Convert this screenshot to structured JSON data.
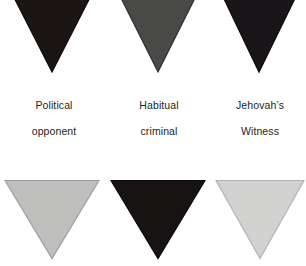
{
  "figure": {
    "background_color": "#ffffff",
    "width": 306,
    "height": 266,
    "label_text_color": "#231f20"
  },
  "badges": [
    {
      "id": "political-opponent",
      "label_line1": "Political",
      "label_line2": "opponent",
      "row": 1,
      "column": 1,
      "fill_color": "#1b1614",
      "edge_color": "#0d0b0a",
      "shape": "inverted-triangle",
      "clipped_top": true
    },
    {
      "id": "habitual-criminal",
      "label_line1": "Habitual",
      "label_line2": "criminal",
      "row": 1,
      "column": 2,
      "fill_color": "#4a4a48",
      "edge_color": "#2e2e2c",
      "shape": "inverted-triangle",
      "clipped_top": true
    },
    {
      "id": "jehovahs-witness",
      "label_line1": "Jehovah’s",
      "label_line2": "Witness",
      "row": 1,
      "column": 3,
      "fill_color": "#1a1518",
      "edge_color": "#0c0a0c",
      "shape": "inverted-triangle",
      "clipped_top": true
    },
    {
      "id": "badge-row2-col1",
      "label_line1": "",
      "label_line2": "",
      "row": 2,
      "column": 1,
      "fill_color": "#bfbfbd",
      "edge_color": "#9d9d9b",
      "shape": "inverted-triangle",
      "clipped_top": false
    },
    {
      "id": "badge-row2-col2",
      "label_line1": "",
      "label_line2": "",
      "row": 2,
      "column": 2,
      "fill_color": "#171312",
      "edge_color": "#0a0808",
      "shape": "inverted-triangle",
      "clipped_top": false
    },
    {
      "id": "badge-row2-col3",
      "label_line1": "",
      "label_line2": "",
      "row": 2,
      "column": 3,
      "fill_color": "#d2d2d0",
      "edge_color": "#b3b3b1",
      "shape": "inverted-triangle",
      "clipped_top": false
    }
  ]
}
